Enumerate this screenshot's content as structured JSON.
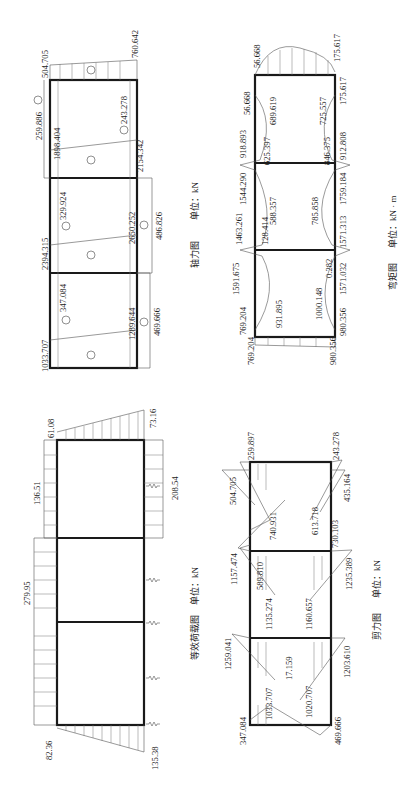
{
  "figures": {
    "axial_force": {
      "caption": "轴力图",
      "unit_label": "单位：kN",
      "labels": {
        "a1": "1033.707",
        "a2": "347.084",
        "a3": "1289.644",
        "a4": "469.666",
        "a5": "2394.315",
        "a6": "329.924",
        "a7": "2650.252",
        "a8": "486.826",
        "a9": "259.886",
        "a10": "1898.404",
        "a11": "243.278",
        "a12": "2154.342",
        "a13": "504.705",
        "a14": "760.642"
      }
    },
    "bending_moment": {
      "caption": "弯矩图",
      "unit_label": "单位：kN · m",
      "labels": {
        "m1": "769.204",
        "m2": "769.204",
        "m3": "931.895",
        "m4": "1000.148",
        "m5": "0.282",
        "m6": "980.356",
        "m7": "980.356",
        "m8": "1591.675",
        "m9": "1571.032",
        "m10": "1463.261",
        "m11": "128.414",
        "m12": "588.357",
        "m13": "785.858",
        "m14": "1571.313",
        "m15": "1544.290",
        "m16": "1759.184",
        "m17": "918.893",
        "m18": "625.397",
        "m19": "846.375",
        "m20": "912.808",
        "m21": "56.668",
        "m22": "689.619",
        "m23": "725.557",
        "m24": "175.617",
        "m25": "56.668",
        "m26": "175.617"
      }
    },
    "equivalent_load": {
      "caption": "等效荷载图",
      "unit_label": "单位：kN",
      "labels": {
        "l1": "82.36",
        "l2": "135.38",
        "l3": "279.95",
        "l4": "136.51",
        "l5": "208.54",
        "l6": "61.08",
        "l7": "73.16"
      }
    },
    "shear_force": {
      "caption": "剪力图",
      "unit_label": "单位：kN",
      "labels": {
        "s1": "347.084",
        "s2": "469.666",
        "s3": "1033.707",
        "s4": "1020.707",
        "s5": "17.159",
        "s6": "1259.041",
        "s7": "1203.610",
        "s8": "1135.274",
        "s9": "1160.657",
        "s10": "589.810",
        "s11": "1157.474",
        "s12": "1235.389",
        "s13": "740.931",
        "s14": "613.718",
        "s15": "730.103",
        "s16": "504.705",
        "s17": "435.164",
        "s18": "259.897",
        "s19": "243.278"
      }
    }
  },
  "colors": {
    "line": "#1a1a1a",
    "hatch": "#777777",
    "background": "#ffffff"
  }
}
